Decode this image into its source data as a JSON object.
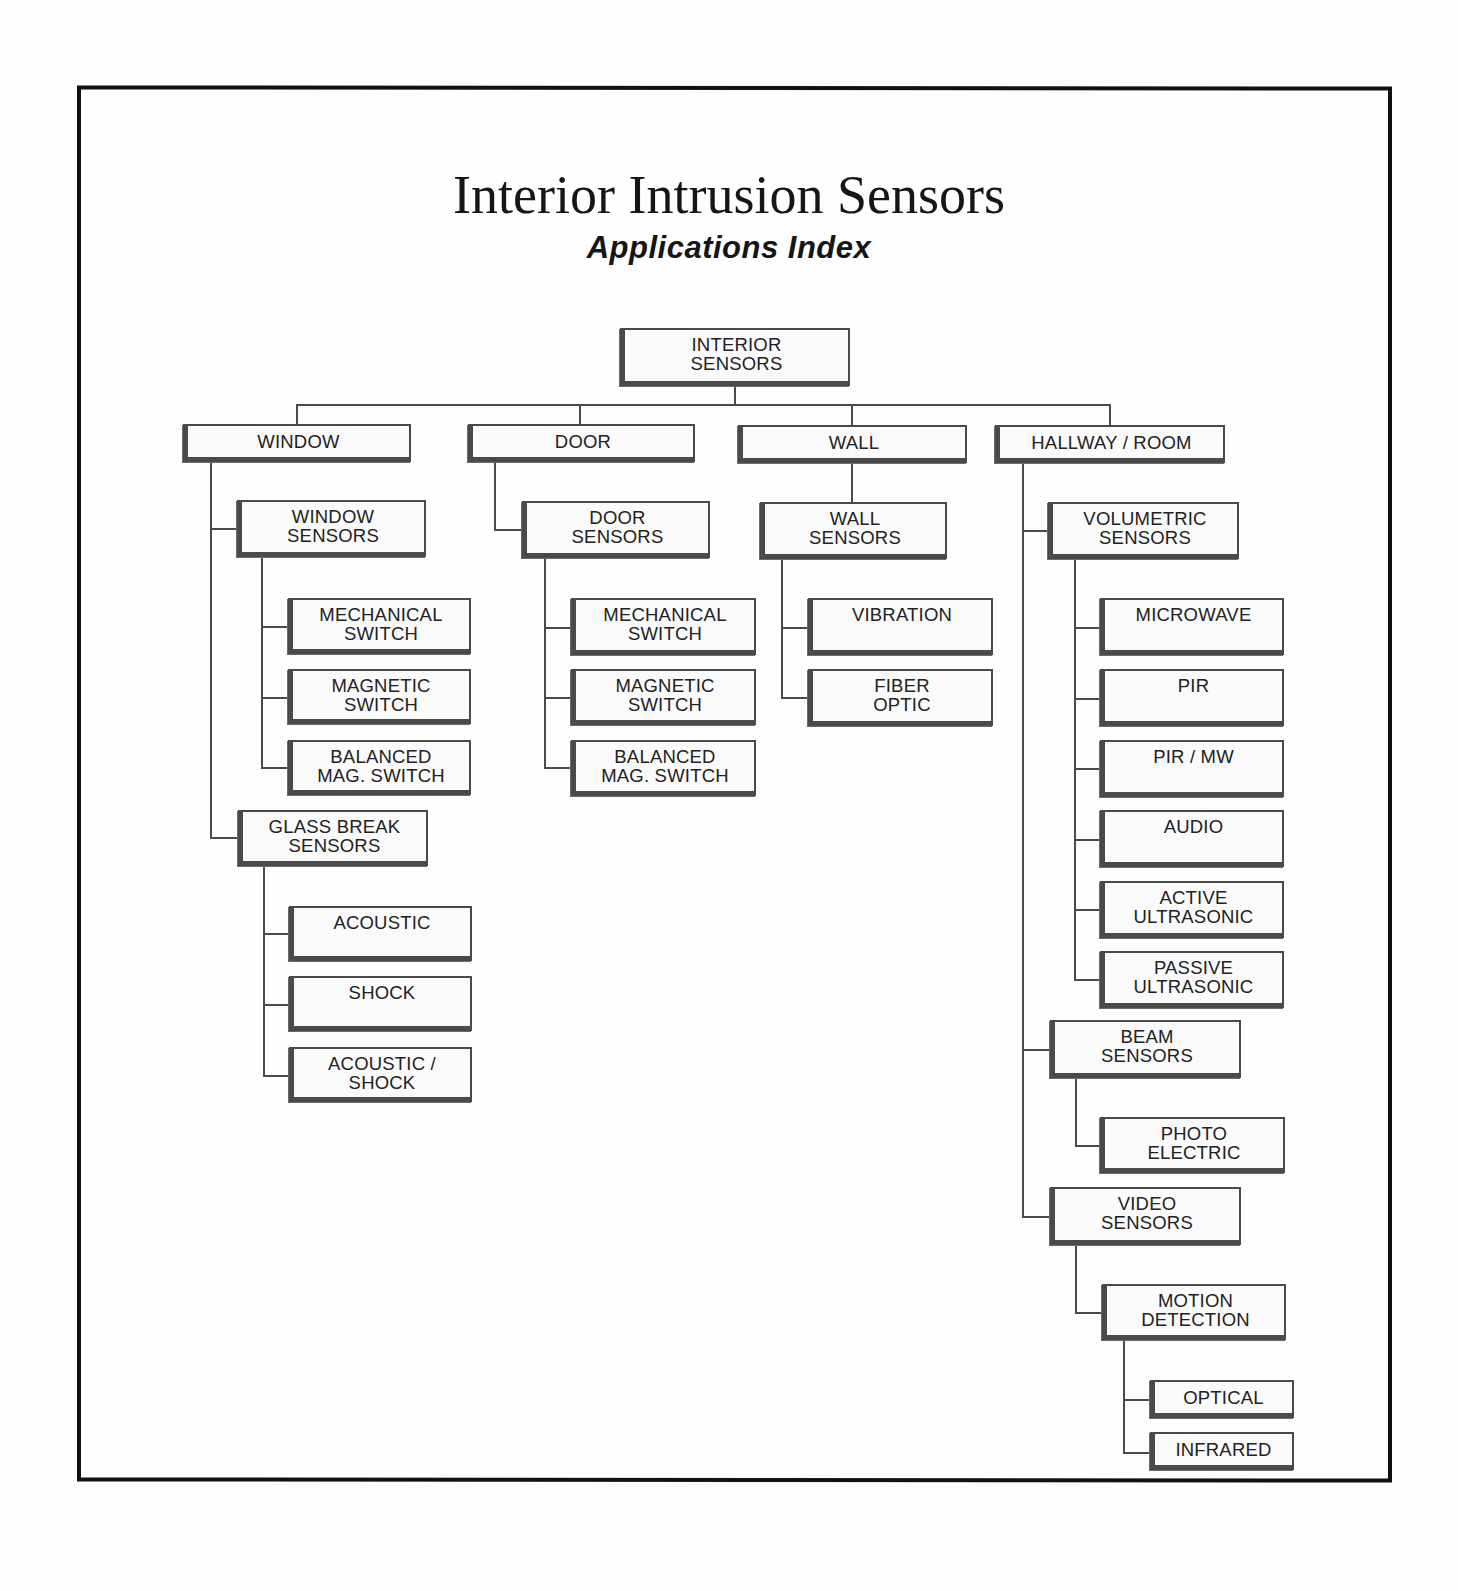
{
  "header": {
    "title": "Interior Intrusion Sensors",
    "subtitle": "Applications Index"
  },
  "tree": {
    "root": {
      "label": "INTERIOR\nSENSORS"
    },
    "categories": [
      {
        "label": "WINDOW",
        "groups": [
          {
            "label": "WINDOW\nSENSORS",
            "items": [
              "MECHANICAL\nSWITCH",
              "MAGNETIC\nSWITCH",
              "BALANCED\nMAG. SWITCH"
            ]
          },
          {
            "label": "GLASS BREAK\nSENSORS",
            "items": [
              "ACOUSTIC",
              "SHOCK",
              "ACOUSTIC /\nSHOCK"
            ]
          }
        ]
      },
      {
        "label": "DOOR",
        "groups": [
          {
            "label": "DOOR\nSENSORS",
            "items": [
              "MECHANICAL\nSWITCH",
              "MAGNETIC\nSWITCH",
              "BALANCED\nMAG. SWITCH"
            ]
          }
        ]
      },
      {
        "label": "WALL",
        "groups": [
          {
            "label": "WALL\nSENSORS",
            "items": [
              "VIBRATION",
              "FIBER\nOPTIC"
            ]
          }
        ]
      },
      {
        "label": "HALLWAY / ROOM",
        "groups": [
          {
            "label": "VOLUMETRIC\nSENSORS",
            "items": [
              "MICROWAVE",
              "PIR",
              "PIR / MW",
              "AUDIO",
              "ACTIVE\nULTRASONIC",
              "PASSIVE\nULTRASONIC"
            ]
          },
          {
            "label": "BEAM\nSENSORS",
            "items": [
              "PHOTO\nELECTRIC"
            ]
          },
          {
            "label": "VIDEO\nSENSORS",
            "items": [
              {
                "label": "MOTION\nDETECTION",
                "items": [
                  "OPTICAL",
                  "INFRARED"
                ]
              }
            ]
          }
        ]
      }
    ]
  },
  "colors": {
    "line": "#4a4a4a",
    "box_fill": "#fafafa",
    "frame": "#111111",
    "text": "#222222"
  }
}
